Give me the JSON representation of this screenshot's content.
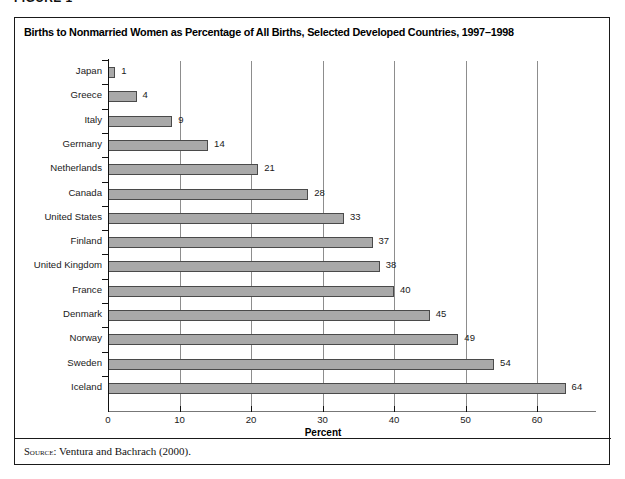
{
  "figure": {
    "label": "FIGURE 1",
    "title": "Births to Nonmarried Women as Percentage of All Births, Selected Developed Countries, 1997–1998",
    "source_prefix": "Source:",
    "source_text": "Ventura and Bachrach (2000)."
  },
  "colors": {
    "bar_fill": "#a9a9a9",
    "bar_border": "#4a4a4a",
    "gridline": "#8d8d8d",
    "frame": "#1a1a1a",
    "text": "#1a1a1a",
    "background": "#ffffff"
  },
  "chart_data": {
    "type": "bar",
    "orientation": "horizontal",
    "title": "Births to Nonmarried Women as Percentage of All Births, Selected Developed Countries, 1997–1998",
    "xlabel": "Percent",
    "ylabel": "",
    "categories": [
      "Japan",
      "Greece",
      "Italy",
      "Germany",
      "Netherlands",
      "Canada",
      "United States",
      "Finland",
      "United Kingdom",
      "France",
      "Denmark",
      "Norway",
      "Sweden",
      "Iceland"
    ],
    "values": [
      1,
      4,
      9,
      14,
      21,
      28,
      33,
      37,
      38,
      40,
      45,
      49,
      54,
      64
    ],
    "data_labels": [
      "1",
      "4",
      "9",
      "14",
      "21",
      "28",
      "33",
      "37",
      "38",
      "40",
      "45",
      "49",
      "54",
      "64"
    ],
    "xlim": [
      0,
      68
    ],
    "xticks": [
      0,
      10,
      20,
      30,
      40,
      50,
      60
    ],
    "xtick_labels": [
      "0",
      "10",
      "20",
      "30",
      "40",
      "50",
      "60"
    ],
    "grid": "vertical",
    "legend": "none",
    "source": "Ventura and Bachrach (2000)."
  }
}
